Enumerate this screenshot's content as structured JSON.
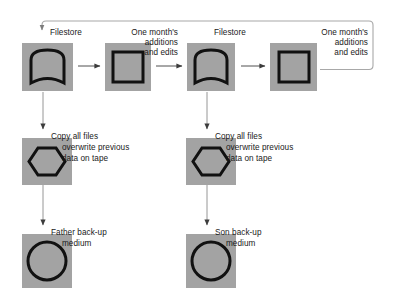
{
  "diagram": {
    "colors": {
      "node_fill": "#a3a3a3",
      "glyph_stroke": "#111111",
      "arrow": "#4a4a4a",
      "loop_line": "#9a9a9a",
      "text": "#1a1a1a",
      "page_background": "#ffffff"
    },
    "nodes": [
      {
        "id": "filestore-1",
        "glyph": "filestore-arch-icon",
        "label": "Filestore"
      },
      {
        "id": "month-additions-1",
        "glyph": "square-icon",
        "label_lines": [
          "One month's",
          "additions",
          "and edits"
        ]
      },
      {
        "id": "filestore-2",
        "glyph": "filestore-arch-icon",
        "label": "Filestore"
      },
      {
        "id": "month-additions-2",
        "glyph": "square-icon",
        "label_lines": [
          "One month's",
          "additions",
          "and edits"
        ]
      },
      {
        "id": "tape-father",
        "glyph": "hexagon-icon",
        "label_lines": [
          "Copy all files",
          "overwrite previous",
          "data on tape"
        ]
      },
      {
        "id": "tape-son",
        "glyph": "hexagon-icon",
        "label_lines": [
          "Copy all files",
          "overwrite previous",
          "data on tape"
        ]
      },
      {
        "id": "backup-father",
        "glyph": "circle-icon",
        "label_lines": [
          "Father back-up",
          "medium"
        ]
      },
      {
        "id": "backup-son",
        "glyph": "circle-icon",
        "label_lines": [
          "Son back-up",
          "medium"
        ]
      }
    ],
    "labels": {
      "filestore_1": "Filestore",
      "filestore_2": "Filestore",
      "month_1_line1": "One month's",
      "month_1_line2": "additions",
      "month_1_line3": "and edits",
      "month_2_line1": "One month's",
      "month_2_line2": "additions",
      "month_2_line3": "and edits",
      "copy_left_line1": "Copy all files",
      "copy_left_line2": "overwrite previous",
      "copy_left_line3": "data on tape",
      "copy_right_line1": "Copy all files",
      "copy_right_line2": "overwrite previous",
      "copy_right_line3": "data on tape",
      "father_line1": "Father back-up",
      "father_line2": "medium",
      "son_line1": "Son back-up",
      "son_line2": "medium"
    },
    "edges": [
      {
        "id": "filestore1-to-month1",
        "type": "horizontal-arrow"
      },
      {
        "id": "month1-to-filestore2",
        "type": "horizontal-arrow"
      },
      {
        "id": "filestore2-to-month2",
        "type": "horizontal-arrow"
      },
      {
        "id": "filestore1-to-tape-father",
        "type": "vertical-arrow"
      },
      {
        "id": "filestore2-to-tape-son",
        "type": "vertical-arrow"
      },
      {
        "id": "tape-father-to-backup-father",
        "type": "vertical-arrow"
      },
      {
        "id": "tape-son-to-backup-son",
        "type": "vertical-arrow"
      },
      {
        "id": "month2-feedback-to-filestore1",
        "type": "loop-arrow"
      }
    ]
  }
}
